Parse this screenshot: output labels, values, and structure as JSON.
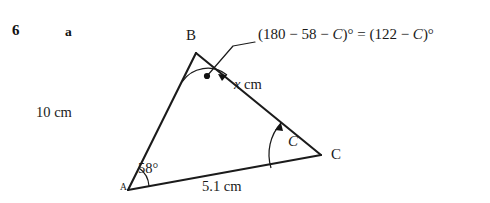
{
  "figure": {
    "question_number": "6",
    "part_label": "a",
    "annotation": {
      "prefix": "(180 − 58 − ",
      "var1": "C",
      "mid": ")° = (122 − ",
      "var2": "C",
      "suffix": ")°",
      "full_text": "(180 − 58 − C)° = (122 − C)°"
    },
    "vertices": [
      {
        "name": "A",
        "label": "A",
        "x": 128,
        "y": 190
      },
      {
        "name": "B",
        "label": "B",
        "x": 196,
        "y": 53
      },
      {
        "name": "C",
        "label": "C",
        "x": 321,
        "y": 155
      }
    ],
    "sides": [
      {
        "name": "AB",
        "label": "10 cm",
        "value": "10",
        "unit": "cm"
      },
      {
        "name": "BC",
        "label_prefix": "x",
        "label_suffix": " cm",
        "value": "x",
        "unit": "cm"
      },
      {
        "name": "AC",
        "label": "5.1 cm",
        "value": "5.1",
        "unit": "cm"
      }
    ],
    "angles": [
      {
        "at": "A",
        "label": "58°",
        "value": "58",
        "unit": "degrees"
      },
      {
        "at": "C",
        "label": "C",
        "value": "C",
        "unit": "unknown"
      },
      {
        "at": "B",
        "label": "(180 − 58 − C)° = (122 − C)°",
        "value": "122 − C",
        "unit": "degrees"
      }
    ],
    "colors": {
      "ink": "#1b1b1b",
      "background": "#ffffff"
    }
  }
}
